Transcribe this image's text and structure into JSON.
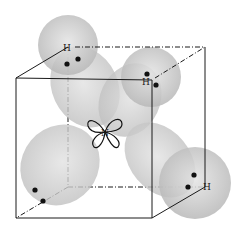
{
  "diagram": {
    "central_atom": {
      "label": "N"
    },
    "hydrogens": [
      {
        "label": "H",
        "position": "top-left-back"
      },
      {
        "label": "H",
        "position": "top-right-front"
      },
      {
        "label": "H",
        "position": "bottom-right-back"
      }
    ],
    "lone_pair_lobe": {
      "position": "bottom-left-front",
      "label": ""
    },
    "colors": {
      "orbital_fill": "#c8c8c8",
      "cube_line": "#1a1a1a",
      "electron": "#111111"
    }
  }
}
